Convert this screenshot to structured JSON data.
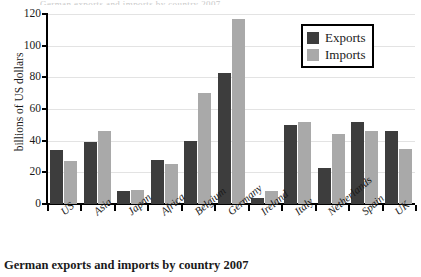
{
  "top_clipped_text": "German exports and imports by country 2007",
  "caption": "German exports and imports by country 2007",
  "legend": {
    "position": "top-right",
    "items": [
      {
        "label": "Exports",
        "color": "#3d3d3d"
      },
      {
        "label": "Imports",
        "color": "#a9a9a9"
      }
    ]
  },
  "axis": {
    "y_title": "billions of US dollars",
    "y_ticks": [
      0,
      20,
      40,
      60,
      80,
      100,
      120
    ]
  },
  "chart_data": {
    "type": "bar",
    "title": "German exports and imports by country 2007",
    "xlabel": "",
    "ylabel": "billions of US dollars",
    "ylim": [
      0,
      120
    ],
    "grid": true,
    "legend_position": "top-right",
    "categories": [
      "US",
      "Asia",
      "Japan",
      "Africa",
      "Belgium",
      "Germany",
      "Ireland",
      "Italy",
      "Netherlands",
      "Spain",
      "UK"
    ],
    "series": [
      {
        "name": "Exports",
        "color": "#3d3d3d",
        "values": [
          34,
          39,
          8,
          28,
          40,
          83,
          4,
          50,
          23,
          52,
          46
        ]
      },
      {
        "name": "Imports",
        "color": "#a9a9a9",
        "values": [
          27,
          46,
          9,
          25,
          70,
          117,
          8,
          52,
          44,
          46,
          35
        ]
      }
    ]
  }
}
